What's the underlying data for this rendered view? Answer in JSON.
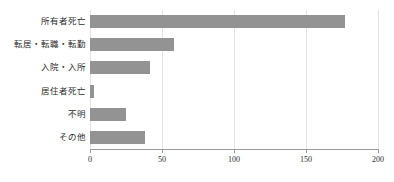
{
  "chart_data": {
    "type": "bar",
    "orientation": "horizontal",
    "title": "",
    "subtitle": "",
    "xlabel": "",
    "ylabel": "",
    "categories": [
      "所有者死亡",
      "転居・転職・転勤",
      "入院・入所",
      "居住者死亡",
      "不明",
      "その他"
    ],
    "values": [
      177,
      58,
      42,
      3,
      25,
      38
    ],
    "xlim": [
      0,
      200
    ],
    "xticks": [
      0,
      50,
      100,
      150,
      200
    ],
    "xtick_labels": [
      "0",
      "50",
      "100",
      "150",
      "200"
    ],
    "grid": true,
    "grid_axis": "x",
    "legend": false,
    "bar_color": "#939393",
    "axis_color": "#9a9a9a",
    "grid_color": "#e3e3e3",
    "text_color": "#2b2b2b",
    "background_color": "#ffffff"
  }
}
